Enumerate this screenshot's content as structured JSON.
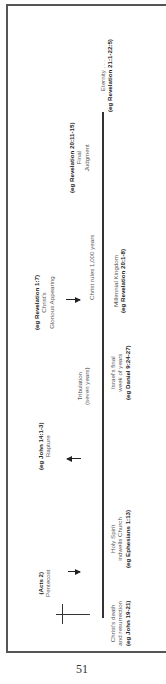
{
  "page_number": "51",
  "events_above_line": [
    {
      "ref": "(Acts 2)",
      "name": "Pentecost",
      "arrow": "right"
    },
    {
      "ref": "(eg John 14:1-3)",
      "name": "Rapture",
      "arrow": "left"
    },
    {
      "ref": "(eg Revelation 1:7)",
      "name_lines": [
        "Christ's",
        "Glorious Appearing"
      ],
      "arrow": "right"
    },
    {
      "ref": "(eg Revelation 20:11-15)",
      "name_lines": [
        "Final",
        "Judgment"
      ]
    }
  ],
  "periods_above_line": [
    {
      "lines": [
        "Tribulation",
        "(seven years)"
      ]
    },
    {
      "lines": [
        "Christ rules 1,000 years"
      ]
    }
  ],
  "eras_below_line": [
    {
      "lines": [
        "Christ's death",
        "and resurrection"
      ],
      "ref": "(eg John 19-21)"
    },
    {
      "lines": [
        "Holy Spirit",
        "indwells Church"
      ],
      "ref": "(eg Ephesians 1:13)"
    },
    {
      "lines": [
        "Israel's final",
        "week of years"
      ],
      "ref": "(eg Daniel 9:24-27)"
    },
    {
      "lines": [
        "Millennial Kingdom"
      ],
      "ref": "(eg Revelation 20:1-8)"
    },
    {
      "lines": [
        "Eternity . . ."
      ],
      "ref": "(eg Revelation 21:1-22:5)"
    }
  ],
  "icons": {
    "cross": "cross-icon"
  }
}
